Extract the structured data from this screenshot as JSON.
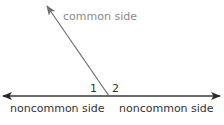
{
  "diagram": {
    "type": "linear-pair-angles",
    "labels": {
      "common_side": "common side",
      "noncommon_left": "noncommon side",
      "noncommon_right": "noncommon side",
      "angle_1": "1",
      "angle_2": "2"
    },
    "colors": {
      "line": "#3a3a3a",
      "common_line": "#6e6e6e",
      "common_text": "#8a8a8a",
      "text": "#333333"
    }
  }
}
